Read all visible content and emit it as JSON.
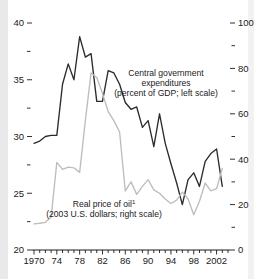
{
  "figure": {
    "background_color": "#ffffff",
    "series_colors": {
      "dark": "#2b2b2b",
      "gray": "#bdbdbd"
    }
  },
  "chart_data": {
    "type": "line",
    "title": "",
    "subtitle": "",
    "xlabel": "",
    "ylabel": "",
    "grid": false,
    "legend_position": "inline-annotation",
    "x_axis": {
      "range": [
        1970,
        2004
      ],
      "tick_labels": [
        "1970",
        "74",
        "78",
        "82",
        "86",
        "90",
        "94",
        "98",
        "2002"
      ],
      "tick_values": [
        1970,
        1974,
        1978,
        1982,
        1986,
        1990,
        1994,
        1998,
        2002
      ],
      "minor_tick_interval": 1
    },
    "y_axis_left": {
      "label_note": "percent of GDP",
      "range": [
        20,
        40
      ],
      "tick_labels": [
        "40",
        "35",
        "30",
        "25",
        "20"
      ],
      "tick_values": [
        40,
        35,
        30,
        25,
        20
      ],
      "minor_tick_values": [
        37.5,
        32.5,
        27.5,
        22.5
      ]
    },
    "y_axis_right": {
      "label_note": "2003 U.S. dollars",
      "range": [
        0,
        100
      ],
      "tick_labels": [
        "100",
        "80",
        "60",
        "40",
        "20",
        "0"
      ],
      "tick_values": [
        100,
        80,
        60,
        40,
        20,
        0
      ],
      "minor_tick_values": [
        90,
        70,
        50,
        30,
        10
      ]
    },
    "series": [
      {
        "name": "Central government expenditures",
        "axis": "left",
        "units": "percent of GDP",
        "color": "#2b2b2b",
        "x": [
          1970,
          1971,
          1972,
          1973,
          1974,
          1975,
          1976,
          1977,
          1978,
          1979,
          1980,
          1981,
          1982,
          1983,
          1984,
          1985,
          1986,
          1987,
          1988,
          1989,
          1990,
          1991,
          1992,
          1993,
          1994,
          1995,
          1996,
          1997,
          1998,
          1999,
          2000,
          2001,
          2002,
          2003
        ],
        "values": [
          29.4,
          29.6,
          30.0,
          30.1,
          30.1,
          34.6,
          36.4,
          35.0,
          38.8,
          37.0,
          37.3,
          33.1,
          33.1,
          35.8,
          35.6,
          34.6,
          33.0,
          32.4,
          32.6,
          30.8,
          31.4,
          29.1,
          32.0,
          29.4,
          27.6,
          25.9,
          24.0,
          26.2,
          26.8,
          25.6,
          27.8,
          28.5,
          28.9,
          25.6
        ]
      },
      {
        "name": "Real price of oil",
        "axis": "right",
        "units": "2003 U.S. dollars",
        "color": "#bdbdbd",
        "x": [
          1970,
          1971,
          1972,
          1973,
          1974,
          1975,
          1976,
          1977,
          1978,
          1979,
          1980,
          1981,
          1982,
          1983,
          1984,
          1985,
          1986,
          1987,
          1988,
          1989,
          1990,
          1991,
          1992,
          1993,
          1994,
          1995,
          1996,
          1997,
          1998,
          1999,
          2000,
          2001,
          2002,
          2003
        ],
        "values": [
          11.5,
          11.8,
          12.2,
          14.5,
          38.6,
          35.5,
          36.5,
          36.2,
          34.2,
          57.0,
          78.0,
          76.0,
          69.0,
          61.0,
          57.0,
          52.0,
          26.0,
          30.0,
          24.5,
          28.0,
          31.0,
          26.5,
          25.0,
          22.5,
          20.5,
          22.0,
          25.5,
          22.5,
          15.5,
          21.5,
          29.5,
          26.0,
          27.0,
          36.0
        ]
      }
    ],
    "annotations": [
      {
        "name": "central-government-expenditures-annotation",
        "lines": [
          "Central government",
          "expenditures",
          "(percent of GDP; left scale)"
        ]
      },
      {
        "name": "real-price-of-oil-annotation",
        "lines": [
          "Real price of oil",
          "(2003 U.S. dollars; right scale)"
        ],
        "footnote_marker": "1"
      }
    ]
  }
}
